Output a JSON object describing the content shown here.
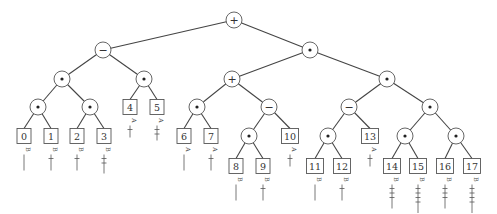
{
  "diagram": {
    "type": "expression-tree",
    "nodes": [
      {
        "id": "n_root",
        "kind": "op",
        "symbol": "+",
        "x": 234,
        "y": 20
      },
      {
        "id": "n_L",
        "kind": "op",
        "symbol": "−",
        "x": 103,
        "y": 50,
        "parent": "n_root"
      },
      {
        "id": "n_R",
        "kind": "op",
        "symbol": "•",
        "x": 310,
        "y": 50,
        "parent": "n_root"
      },
      {
        "id": "n_LL",
        "kind": "op",
        "symbol": "•",
        "x": 62,
        "y": 79,
        "parent": "n_L"
      },
      {
        "id": "n_LR",
        "kind": "op",
        "symbol": "•",
        "x": 144,
        "y": 79,
        "parent": "n_L"
      },
      {
        "id": "n_RL",
        "kind": "op",
        "symbol": "+",
        "x": 232,
        "y": 79,
        "parent": "n_R"
      },
      {
        "id": "n_RR",
        "kind": "op",
        "symbol": "•",
        "x": 387,
        "y": 79,
        "parent": "n_R"
      },
      {
        "id": "n_LLL",
        "kind": "op",
        "symbol": "•",
        "x": 38,
        "y": 107,
        "parent": "n_LL"
      },
      {
        "id": "n_LLR",
        "kind": "op",
        "symbol": "•",
        "x": 90,
        "y": 107,
        "parent": "n_LL"
      },
      {
        "id": "leaf4",
        "kind": "leaf",
        "label": "4",
        "x": 130,
        "y": 107,
        "parent": "n_LR",
        "tag": "A",
        "ticks": 1,
        "stem": 0
      },
      {
        "id": "leaf5",
        "kind": "leaf",
        "label": "5",
        "x": 157,
        "y": 107,
        "parent": "n_LR",
        "tag": "A",
        "ticks": 2,
        "stem": 0
      },
      {
        "id": "n_RLL",
        "kind": "op",
        "symbol": "•",
        "x": 197,
        "y": 107,
        "parent": "n_RL"
      },
      {
        "id": "n_RLR",
        "kind": "op",
        "symbol": "−",
        "x": 269,
        "y": 107,
        "parent": "n_RL"
      },
      {
        "id": "n_RRL",
        "kind": "op",
        "symbol": "−",
        "x": 349,
        "y": 107,
        "parent": "n_RR"
      },
      {
        "id": "n_RRR",
        "kind": "op",
        "symbol": "•",
        "x": 430,
        "y": 107,
        "parent": "n_RR"
      },
      {
        "id": "leaf0",
        "kind": "leaf",
        "label": "0",
        "x": 24,
        "y": 136,
        "parent": "n_LLL",
        "tag": "B",
        "ticks": 0,
        "stem": 1
      },
      {
        "id": "leaf1",
        "kind": "leaf",
        "label": "1",
        "x": 51,
        "y": 136,
        "parent": "n_LLL",
        "tag": "B",
        "ticks": 1,
        "stem": 1
      },
      {
        "id": "leaf2",
        "kind": "leaf",
        "label": "2",
        "x": 77,
        "y": 136,
        "parent": "n_LLR",
        "tag": "B",
        "ticks": 1,
        "stem": 1
      },
      {
        "id": "leaf3",
        "kind": "leaf",
        "label": "3",
        "x": 104,
        "y": 136,
        "parent": "n_LLR",
        "tag": "B",
        "ticks": 2,
        "stem": 1
      },
      {
        "id": "leaf6",
        "kind": "leaf",
        "label": "6",
        "x": 184,
        "y": 136,
        "parent": "n_RLL",
        "tag": "A",
        "ticks": 0,
        "stem": 1
      },
      {
        "id": "leaf7",
        "kind": "leaf",
        "label": "7",
        "x": 211,
        "y": 136,
        "parent": "n_RLL",
        "tag": "A",
        "ticks": 1,
        "stem": 1
      },
      {
        "id": "n_RLRL",
        "kind": "op",
        "symbol": "•",
        "x": 249,
        "y": 136,
        "parent": "n_RLR"
      },
      {
        "id": "leaf10",
        "kind": "leaf",
        "label": "10",
        "x": 290,
        "y": 136,
        "parent": "n_RLR",
        "tag": "A",
        "ticks": 1,
        "stem": 0
      },
      {
        "id": "n_RRLL",
        "kind": "op",
        "symbol": "•",
        "x": 328,
        "y": 136,
        "parent": "n_RRL"
      },
      {
        "id": "leaf13",
        "kind": "leaf",
        "label": "13",
        "x": 370,
        "y": 136,
        "parent": "n_RRL",
        "tag": "A",
        "ticks": 1,
        "stem": 0
      },
      {
        "id": "n_RRRL",
        "kind": "op",
        "symbol": "•",
        "x": 405,
        "y": 136,
        "parent": "n_RRR"
      },
      {
        "id": "n_RRRR",
        "kind": "op",
        "symbol": "•",
        "x": 456,
        "y": 136,
        "parent": "n_RRR"
      },
      {
        "id": "leaf8",
        "kind": "leaf",
        "label": "8",
        "x": 236,
        "y": 166,
        "parent": "n_RLRL",
        "tag": "B",
        "ticks": 0,
        "stem": 1
      },
      {
        "id": "leaf9",
        "kind": "leaf",
        "label": "9",
        "x": 263,
        "y": 166,
        "parent": "n_RLRL",
        "tag": "B",
        "ticks": 1,
        "stem": 1
      },
      {
        "id": "leaf11",
        "kind": "leaf",
        "label": "11",
        "x": 315,
        "y": 166,
        "parent": "n_RRLL",
        "tag": "B",
        "ticks": 0,
        "stem": 1
      },
      {
        "id": "leaf12",
        "kind": "leaf",
        "label": "12",
        "x": 342,
        "y": 166,
        "parent": "n_RRLL",
        "tag": "B",
        "ticks": 1,
        "stem": 1
      },
      {
        "id": "leaf14",
        "kind": "leaf",
        "label": "14",
        "x": 392,
        "y": 166,
        "parent": "n_RRRL",
        "tag": "B",
        "ticks": 3,
        "stem": 1
      },
      {
        "id": "leaf15",
        "kind": "leaf",
        "label": "15",
        "x": 418,
        "y": 166,
        "parent": "n_RRRL",
        "tag": "B",
        "ticks": 4,
        "stem": 1
      },
      {
        "id": "leaf16",
        "kind": "leaf",
        "label": "16",
        "x": 445,
        "y": 166,
        "parent": "n_RRRR",
        "tag": "B",
        "ticks": 3,
        "stem": 1
      },
      {
        "id": "leaf17",
        "kind": "leaf",
        "label": "17",
        "x": 472,
        "y": 166,
        "parent": "n_RRRR",
        "tag": "B",
        "ticks": 4,
        "stem": 1
      }
    ]
  }
}
